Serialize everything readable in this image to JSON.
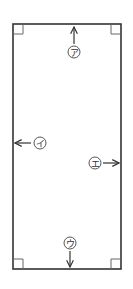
{
  "diagram": {
    "colors": {
      "stroke": "#333333",
      "corner": "#555555",
      "label": "#333333"
    },
    "rectangle": {
      "x": 13,
      "y": 24,
      "width": 108,
      "height": 245
    },
    "labels": [
      {
        "id": "a",
        "text": "ア",
        "direction": "up"
      },
      {
        "id": "i",
        "text": "イ",
        "direction": "left"
      },
      {
        "id": "u",
        "text": "ウ",
        "direction": "down"
      },
      {
        "id": "e",
        "text": "エ",
        "direction": "right"
      }
    ]
  }
}
